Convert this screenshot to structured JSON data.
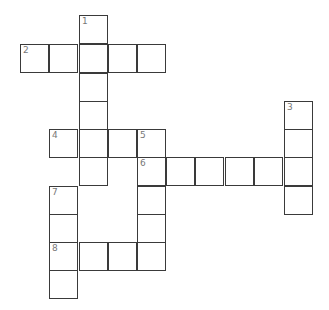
{
  "puzzle": {
    "type": "crossword",
    "cell_size": 29,
    "origin": {
      "x": 20,
      "y": 15
    },
    "cells": [
      {
        "col": 2,
        "row": 0,
        "number": "1"
      },
      {
        "col": 0,
        "row": 1,
        "number": "2"
      },
      {
        "col": 1,
        "row": 1
      },
      {
        "col": 2,
        "row": 1
      },
      {
        "col": 3,
        "row": 1
      },
      {
        "col": 4,
        "row": 1
      },
      {
        "col": 2,
        "row": 2
      },
      {
        "col": 2,
        "row": 3
      },
      {
        "col": 9,
        "row": 3,
        "number": "3"
      },
      {
        "col": 1,
        "row": 4,
        "number": "4"
      },
      {
        "col": 2,
        "row": 4
      },
      {
        "col": 3,
        "row": 4
      },
      {
        "col": 4,
        "row": 4,
        "number": "5"
      },
      {
        "col": 9,
        "row": 4
      },
      {
        "col": 2,
        "row": 5
      },
      {
        "col": 4,
        "row": 5,
        "number": "6"
      },
      {
        "col": 5,
        "row": 5
      },
      {
        "col": 6,
        "row": 5
      },
      {
        "col": 7,
        "row": 5
      },
      {
        "col": 8,
        "row": 5
      },
      {
        "col": 9,
        "row": 5
      },
      {
        "col": 1,
        "row": 6,
        "number": "7"
      },
      {
        "col": 4,
        "row": 6
      },
      {
        "col": 9,
        "row": 6
      },
      {
        "col": 1,
        "row": 7
      },
      {
        "col": 4,
        "row": 7
      },
      {
        "col": 1,
        "row": 8,
        "number": "8"
      },
      {
        "col": 2,
        "row": 8
      },
      {
        "col": 3,
        "row": 8
      },
      {
        "col": 4,
        "row": 8
      },
      {
        "col": 1,
        "row": 9
      }
    ],
    "clue_numbers": [
      "1",
      "2",
      "3",
      "4",
      "5",
      "6",
      "7",
      "8"
    ]
  },
  "colors": {
    "border": "#3a3a3a",
    "number": "#777777",
    "background": "#ffffff"
  }
}
